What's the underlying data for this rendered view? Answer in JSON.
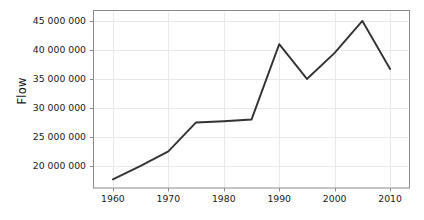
{
  "chart_data": {
    "type": "line",
    "title": "",
    "subtitle": "",
    "xlabel": "",
    "ylabel": "Flow",
    "x": [
      1960,
      1965,
      1970,
      1975,
      1980,
      1985,
      1990,
      1995,
      2000,
      2005,
      2010
    ],
    "values": [
      17700000,
      20000000,
      22500000,
      27500000,
      27700000,
      28000000,
      41000000,
      35000000,
      39500000,
      45000000,
      36700000
    ],
    "series": [
      {
        "name": "Flow",
        "values": [
          17700000,
          20000000,
          22500000,
          27500000,
          27700000,
          28000000,
          41000000,
          35000000,
          39500000,
          45000000,
          36700000
        ]
      }
    ],
    "xlim": [
      1956.5,
      2013.5
    ],
    "ylim": [
      16200000,
      46800000
    ],
    "xticks": [
      1960,
      1970,
      1980,
      1990,
      2000,
      2010
    ],
    "xtick_labels": [
      "1960",
      "1970",
      "1980",
      "1990",
      "2000",
      "2010"
    ],
    "yticks": [
      20000000,
      25000000,
      30000000,
      35000000,
      40000000,
      45000000
    ],
    "ytick_labels": [
      "20 000 000",
      "25 000 000",
      "30 000 000",
      "35 000 000",
      "40 000 000",
      "45 000 000"
    ],
    "grid": true,
    "legend": null,
    "legend_position": "none",
    "annotations": [],
    "colors": {
      "line": "#333333",
      "grid": "#e8e8ec",
      "axis_border": "#8a8a8a",
      "tick": "#8a8a8a",
      "text": "#1a1a1a",
      "background": "#ffffff"
    }
  }
}
